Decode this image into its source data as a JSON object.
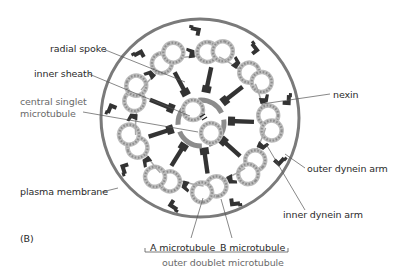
{
  "figure": {
    "panel_label": "(B)",
    "colors": {
      "membrane": "#7a7a7a",
      "tubule_ring": "#b8b8b8",
      "tubule_dots": "#9a9a9a",
      "dark_parts": "#333333",
      "sheath": "#8c8c8c",
      "leader": "#555555",
      "text": "#2a2a2a",
      "gray_text": "#6a6a6a"
    }
  },
  "labels": {
    "radial_spoke": "radial spoke",
    "inner_sheath": "inner sheath",
    "central_singlet_line1": "central singlet",
    "central_singlet_line2": "microtubule",
    "plasma_membrane": "plasma membrane",
    "nexin": "nexin",
    "outer_dynein_arm": "outer dynein arm",
    "inner_dynein_arm": "inner dynein arm",
    "a_microtubule": "A microtubule",
    "b_microtubule": "B microtubule",
    "outer_doublet": "outer doublet microtubule"
  },
  "structure": {
    "outer_doublets": 9,
    "central_singlets": 2
  }
}
